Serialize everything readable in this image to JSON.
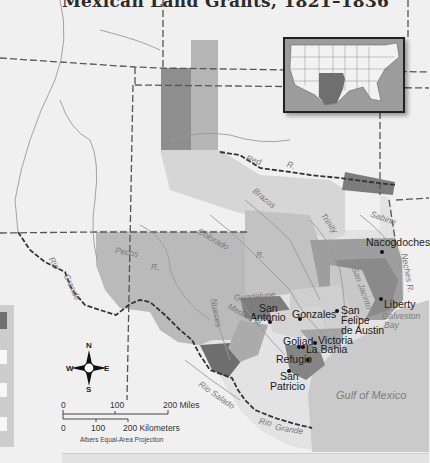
{
  "title": "Mexican Land Grants, 1821–1836",
  "cities": [
    {
      "name": "Nacogdoches",
      "x": 366,
      "y": 243,
      "dotx": 381,
      "doty": 256
    },
    {
      "name": "San",
      "x": 258,
      "y": 304,
      "dotx": 268,
      "doty": 321
    },
    {
      "name": "Antonio",
      "x": 250,
      "y": 313
    },
    {
      "name": "Gonzales",
      "x": 292,
      "y": 311,
      "dotx": 299,
      "doty": 317
    },
    {
      "name": "San",
      "x": 342,
      "y": 306,
      "dotx": 336,
      "doty": 309
    },
    {
      "name": "Felipe",
      "x": 342,
      "y": 316
    },
    {
      "name": "de Austin",
      "x": 342,
      "y": 326
    },
    {
      "name": "Liberty",
      "x": 385,
      "y": 297,
      "dotx": 380,
      "doty": 298
    },
    {
      "name": "Goliad",
      "x": 283,
      "y": 338,
      "dotx": 298,
      "doty": 345
    },
    {
      "name": "Victoria",
      "x": 318,
      "y": 336,
      "dotx": 313,
      "doty": 342
    },
    {
      "name": "La Bahia",
      "x": 306,
      "y": 344,
      "dotx": 302,
      "doty": 345
    },
    {
      "name": "Refugio",
      "x": 276,
      "y": 356,
      "dotx": 307,
      "doty": 359
    },
    {
      "name": "San",
      "x": 277,
      "y": 372,
      "dotx": 288,
      "doty": 370
    },
    {
      "name": "Patricio",
      "x": 270,
      "y": 382
    }
  ],
  "rivers": [
    {
      "name": "Red",
      "x": 246,
      "y": 159,
      "rot": 18
    },
    {
      "name": "R.",
      "x": 287,
      "y": 163,
      "rot": 15
    },
    {
      "name": "Brazos",
      "x": 251,
      "y": 193,
      "rot": 40
    },
    {
      "name": "Trinity",
      "x": 320,
      "y": 218,
      "rot": 55
    },
    {
      "name": "Sabine",
      "x": 370,
      "y": 215,
      "rot": 20
    },
    {
      "name": "Colorado",
      "x": 198,
      "y": 236,
      "rot": 30
    },
    {
      "name": "R.",
      "x": 256,
      "y": 250,
      "rot": 0
    },
    {
      "name": "Pecos",
      "x": 116,
      "y": 250,
      "rot": 10
    },
    {
      "name": "R.",
      "x": 151,
      "y": 262,
      "rot": 0
    },
    {
      "name": "Rio",
      "x": 50,
      "y": 260,
      "rot": 60
    },
    {
      "name": "Grande",
      "x": 62,
      "y": 278,
      "rot": 65
    },
    {
      "name": "Guadalupe",
      "x": 236,
      "y": 294,
      "rot": -5
    },
    {
      "name": "Medina R.",
      "x": 228,
      "y": 306,
      "rot": 30
    },
    {
      "name": "Nueces",
      "x": 211,
      "y": 296,
      "rot": 80
    },
    {
      "name": "Neches R.",
      "x": 394,
      "y": 260,
      "rot": 80
    },
    {
      "name": "San Jacinto",
      "x": 351,
      "y": 278,
      "rot": 70
    },
    {
      "name": "Galveston",
      "x": 382,
      "y": 314,
      "rot": 0
    },
    {
      "name": "Bay",
      "x": 378,
      "y": 322,
      "rot": 0
    },
    {
      "name": "Rio Salado",
      "x": 200,
      "y": 385,
      "rot": 35
    },
    {
      "name": "Rio",
      "x": 260,
      "y": 420,
      "rot": 10
    },
    {
      "name": "Grande",
      "x": 276,
      "y": 425,
      "rot": 10
    }
  ],
  "gulf_label": "Gulf of Mexico",
  "compass": {
    "n": "N",
    "s": "S",
    "e": "E",
    "w": "W"
  },
  "scale": {
    "miles": [
      "0",
      "100",
      "200 Miles"
    ],
    "km": [
      "0",
      "100",
      "200 Kilometers"
    ],
    "projection": "Albers Equal-Area Projection"
  },
  "colors": {
    "background": "#f2f2f2",
    "land_light": "#e6e6e6",
    "grant_pale": "#dcdcdc",
    "grant_mid": "#b4b4b4",
    "grant_dark": "#8a8a8a",
    "grant_darkest": "#6b6b6b",
    "gulf": "#c9c9c9"
  }
}
